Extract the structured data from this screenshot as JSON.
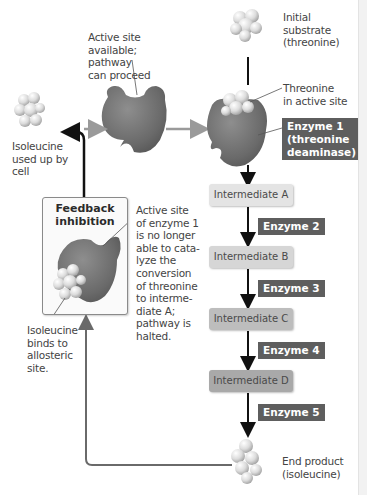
{
  "labels": {
    "initial_substrate": [
      "Initial",
      "substrate",
      "(threonine)"
    ],
    "active_site_available": [
      "Active site",
      "available;",
      "pathway",
      "can proceed"
    ],
    "threonine_in_active_site": [
      "Threonine",
      "in active site"
    ],
    "isoleucine_used_up": [
      "Isoleucine",
      "used up by",
      "cell"
    ],
    "active_site_inhibited": [
      "Active site",
      "of enzyme 1",
      "is no longer",
      "able to cata-",
      "lyze the",
      "conversion",
      "of threonine",
      "to interme-",
      "diate A;",
      "pathway is",
      "halted."
    ],
    "isoleucine_binds": [
      "Isoleucine",
      "binds to",
      "allosteric",
      "site."
    ],
    "end_product": [
      "End product",
      "(isoleucine)"
    ]
  },
  "feedback_box": {
    "title_line1": "Feedback",
    "title_line2": "inhibition"
  },
  "enzyme1": {
    "line1": "Enzyme 1",
    "line2": "(threonine",
    "line3": "deaminase)"
  },
  "intermediates": [
    {
      "label": "Intermediate A",
      "color": "#e4e4e4"
    },
    {
      "label": "Intermediate B",
      "color": "#d6d6d6"
    },
    {
      "label": "Intermediate C",
      "color": "#bdbdbd"
    },
    {
      "label": "Intermediate D",
      "color": "#a9a9a9"
    }
  ],
  "enzymes": [
    "Enzyme 2",
    "Enzyme 3",
    "Enzyme 4",
    "Enzyme 5"
  ],
  "colors": {
    "enzyme_label_bg": "#5e5e5e",
    "enzyme_body": "#707070",
    "arrow_dark": "#111111",
    "arrow_gray": "#9a9a9a",
    "feedback_line": "#6a6a6a"
  }
}
